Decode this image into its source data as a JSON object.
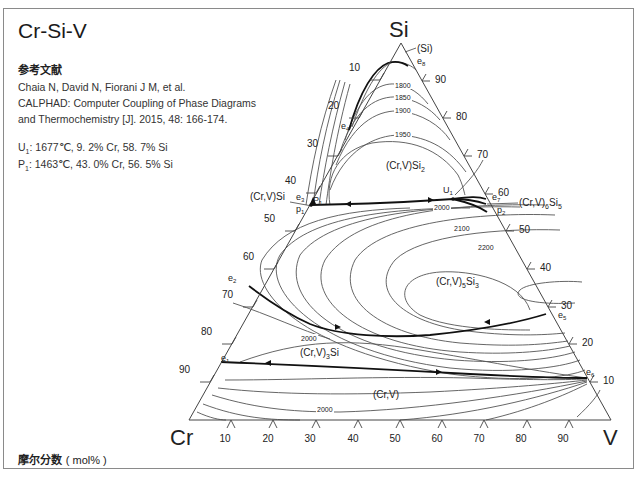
{
  "title": "Cr-Si-V",
  "reference": {
    "heading": "参考文献",
    "lines": [
      "Chaia N, David N, Fiorani J M, et al.",
      "CALPHAD: Computer Coupling of Phase Diagrams",
      "and Thermochemistry [J]. 2015, 48: 166-174."
    ]
  },
  "invariant_points": [
    {
      "label": "U",
      "sub": "1",
      "text": ": 1677℃, 9. 2% Cr, 58. 7% Si"
    },
    {
      "label": "P",
      "sub": "1",
      "text": ": 1463℃, 43. 0% Cr, 56. 5% Si"
    }
  ],
  "footer": {
    "label": "摩尔分数",
    "unit": "( mol% )"
  },
  "diagram": {
    "vertices": {
      "top": "Si",
      "left": "Cr",
      "right": "V"
    },
    "left_axis_ticks": [
      "10",
      "20",
      "30",
      "40",
      "50",
      "60",
      "70",
      "80",
      "90"
    ],
    "right_axis_ticks": [
      "90",
      "80",
      "70",
      "60",
      "50",
      "40",
      "30",
      "20",
      "10"
    ],
    "bottom_axis_ticks": [
      "10",
      "20",
      "30",
      "40",
      "50",
      "60",
      "70",
      "80",
      "90"
    ],
    "phase_labels": {
      "si": "(Si)",
      "cr_v_si2": "(Cr,V)Si",
      "cr_v_si": "(Cr,V)Si",
      "cr_v_6si5": "(Cr,V)",
      "cr_v_5si3": "(Cr,V)",
      "cr_v_3si": "(Cr,V)",
      "cr_v": "(Cr,V)"
    },
    "point_labels": [
      "e1",
      "e2",
      "e3",
      "e4",
      "e5",
      "e6",
      "e7",
      "e8",
      "p1",
      "p2",
      "P1",
      "U1"
    ],
    "isotherm_labels": [
      "1800",
      "1850",
      "1900",
      "1950",
      "2000",
      "2100",
      "2200",
      "2000",
      "2000"
    ],
    "colors": {
      "line": "#555555",
      "bold_line": "#111111",
      "frame": "#8a8a8a"
    }
  }
}
